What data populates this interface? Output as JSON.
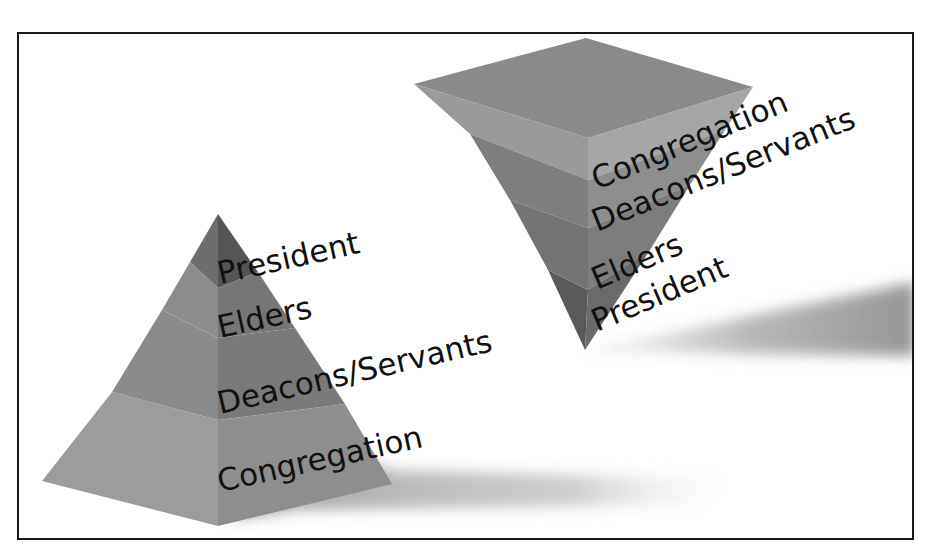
{
  "diagram": {
    "type": "pyramid-comparison",
    "left_pyramid": {
      "orientation": "upright",
      "layers_top_to_bottom": [
        {
          "label": "President"
        },
        {
          "label": "Elders"
        },
        {
          "label": "Deacons/Servants"
        },
        {
          "label": "Congregation"
        }
      ]
    },
    "right_pyramid": {
      "orientation": "inverted",
      "layers_top_to_bottom": [
        {
          "label": "Congregation"
        },
        {
          "label": "Deacons/Servants"
        },
        {
          "label": "Elders"
        },
        {
          "label": "President"
        }
      ]
    },
    "colors": {
      "border": "#1a1a1a",
      "text": "#111111",
      "shadow": "#9a9a9a"
    }
  }
}
